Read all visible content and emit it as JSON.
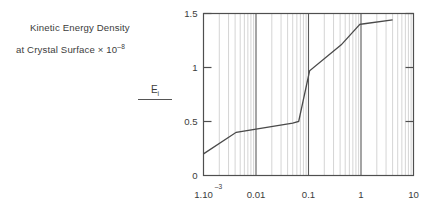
{
  "figure": {
    "caption_line_1": "Kinetic Energy Density",
    "caption_line_2_main": "at Crystal Surface × 10",
    "caption_line_2_exp": "–8",
    "y_axis_symbol": "E",
    "y_axis_symbol_sub": "i",
    "y_axis_denominator": ""
  },
  "chart_data": {
    "type": "line",
    "xlabel": "",
    "ylabel": "E_i",
    "xscale": "log",
    "yscale": "linear",
    "xlim": [
      0.001,
      10
    ],
    "ylim": [
      0,
      1.5
    ],
    "grid": "minor-vertical-log",
    "legend": "none",
    "x_tick_labels": [
      "1.10",
      "0.01",
      "0.1",
      "1",
      "10"
    ],
    "x_tick_first_exponent": "–3",
    "x_tick_values": [
      0.001,
      0.01,
      0.1,
      1,
      10
    ],
    "y_tick_labels": [
      "0",
      "0.5",
      "1",
      "1.5"
    ],
    "y_tick_values": [
      0,
      0.5,
      1,
      1.5
    ],
    "series": [
      {
        "name": "kinetic-energy-density",
        "color": "#4a4a4a",
        "x": [
          0.001,
          0.0042,
          0.05,
          0.065,
          0.105,
          0.42,
          0.95,
          1.15,
          4.0
        ],
        "y": [
          0.2,
          0.4,
          0.485,
          0.5,
          0.97,
          1.21,
          1.4,
          1.405,
          1.44
        ]
      }
    ]
  },
  "colors": {
    "background": "#ffffff",
    "axis": "#4f4f4f",
    "text": "#3c3c3c",
    "curve": "#4a4a4a",
    "minor_grid": "#c9c9c9",
    "major_grid": "#5a5a5a"
  }
}
